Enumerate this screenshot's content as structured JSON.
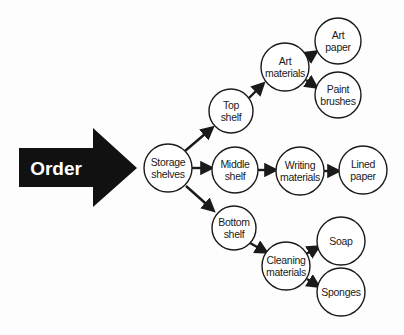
{
  "diagram": {
    "type": "flow-tree",
    "background": "#fdfdfd",
    "stroke_color": "#1a1a1a",
    "start_arrow": {
      "label": "Order",
      "fill": "#111111",
      "text_color": "#ffffff"
    },
    "nodes": [
      {
        "id": "storage_shelves",
        "lines": [
          "Storage",
          "shelves"
        ],
        "cx": 168,
        "cy": 168,
        "r": 24
      },
      {
        "id": "top_shelf",
        "lines": [
          "Top",
          "shelf"
        ],
        "cx": 231,
        "cy": 111,
        "r": 22
      },
      {
        "id": "middle_shelf",
        "lines": [
          "Middle",
          "shelf"
        ],
        "cx": 235,
        "cy": 170,
        "r": 23
      },
      {
        "id": "bottom_shelf",
        "lines": [
          "Bottom",
          "shelf"
        ],
        "cx": 234,
        "cy": 228,
        "r": 22
      },
      {
        "id": "art_materials",
        "lines": [
          "Art",
          "materials"
        ],
        "cx": 285,
        "cy": 67,
        "r": 24
      },
      {
        "id": "art_paper",
        "lines": [
          "Art",
          "paper"
        ],
        "cx": 338,
        "cy": 41,
        "r": 23
      },
      {
        "id": "paint_brushes",
        "lines": [
          "Paint",
          "brushes"
        ],
        "cx": 338,
        "cy": 95,
        "r": 23
      },
      {
        "id": "writing_materials",
        "lines": [
          "Writing",
          "materials"
        ],
        "cx": 300,
        "cy": 171,
        "r": 24
      },
      {
        "id": "lined_paper",
        "lines": [
          "Lined",
          "paper"
        ],
        "cx": 363,
        "cy": 170,
        "r": 24
      },
      {
        "id": "cleaning_materials",
        "lines": [
          "Cleaning",
          "materials"
        ],
        "cx": 286,
        "cy": 266,
        "r": 24
      },
      {
        "id": "soap",
        "lines": [
          "Soap"
        ],
        "cx": 341,
        "cy": 241,
        "r": 24
      },
      {
        "id": "sponges",
        "lines": [
          "Sponges"
        ],
        "cx": 341,
        "cy": 292,
        "r": 24
      }
    ],
    "edges": [
      {
        "from": "order",
        "to": "storage_shelves"
      },
      {
        "from": "storage_shelves",
        "to": "top_shelf",
        "x1": 185,
        "y1": 151,
        "x2": 212,
        "y2": 128
      },
      {
        "from": "storage_shelves",
        "to": "middle_shelf",
        "x1": 192,
        "y1": 168,
        "x2": 211,
        "y2": 168
      },
      {
        "from": "storage_shelves",
        "to": "bottom_shelf",
        "x1": 186,
        "y1": 186,
        "x2": 213,
        "y2": 210
      },
      {
        "from": "top_shelf",
        "to": "art_materials",
        "x1": 249,
        "y1": 98,
        "x2": 263,
        "y2": 84
      },
      {
        "from": "art_materials",
        "to": "art_paper",
        "x1": 307,
        "y1": 58,
        "x2": 316,
        "y2": 52
      },
      {
        "from": "art_materials",
        "to": "paint_brushes",
        "x1": 306,
        "y1": 80,
        "x2": 316,
        "y2": 87
      },
      {
        "from": "middle_shelf",
        "to": "writing_materials",
        "x1": 258,
        "y1": 170,
        "x2": 275,
        "y2": 170
      },
      {
        "from": "writing_materials",
        "to": "lined_paper",
        "x1": 324,
        "y1": 171,
        "x2": 338,
        "y2": 171
      },
      {
        "from": "bottom_shelf",
        "to": "cleaning_materials",
        "x1": 250,
        "y1": 243,
        "x2": 266,
        "y2": 252
      },
      {
        "from": "cleaning_materials",
        "to": "soap",
        "x1": 306,
        "y1": 254,
        "x2": 318,
        "y2": 247
      },
      {
        "from": "cleaning_materials",
        "to": "sponges",
        "x1": 307,
        "y1": 279,
        "x2": 318,
        "y2": 286
      }
    ]
  }
}
